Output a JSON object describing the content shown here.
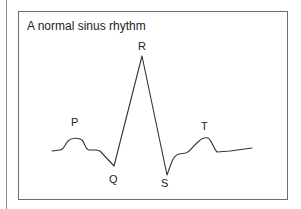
{
  "figure": {
    "title": "A normal sinus rhythm",
    "labels": {
      "p": "P",
      "q": "Q",
      "r": "R",
      "s": "S",
      "t": "T"
    },
    "colors": {
      "stroke": "#333333",
      "frame": "#6e6e6e",
      "background": "#ffffff"
    }
  }
}
